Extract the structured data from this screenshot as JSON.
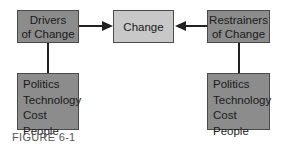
{
  "diagram": {
    "drivers": {
      "line1": "Drivers",
      "line2": "of Change"
    },
    "change": {
      "label": "Change"
    },
    "restrainers": {
      "line1": "Restrainers",
      "line2": "of Change"
    },
    "driver_factors": [
      "Politics",
      "Technology",
      "Cost",
      "People"
    ],
    "restrainer_factors": [
      "Politics",
      "Technology",
      "Cost",
      "People"
    ],
    "caption": "FIGURE 6-1",
    "colors": {
      "dark_box": "#8c8c8c",
      "light_box": "#c8c8c8",
      "line": "#222222"
    }
  }
}
